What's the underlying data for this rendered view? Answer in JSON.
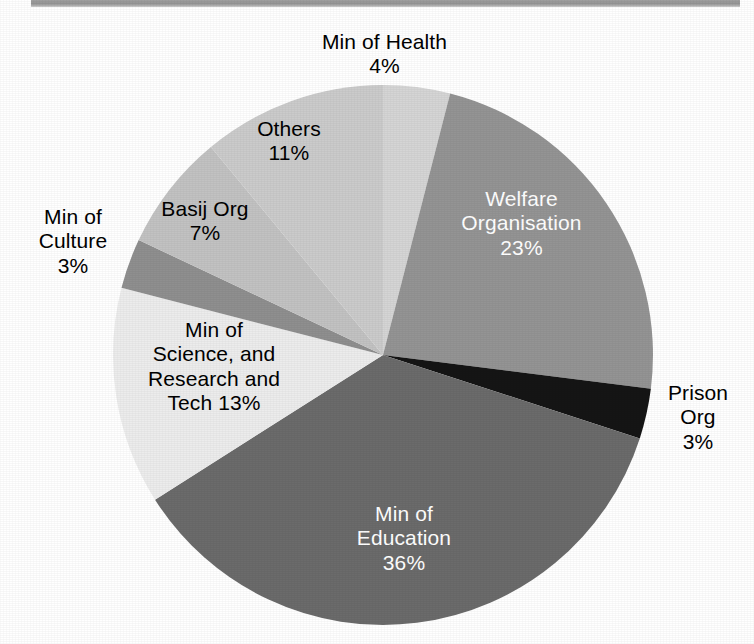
{
  "chart_data": {
    "type": "pie",
    "title": "",
    "subtitle": "",
    "xlabel": "",
    "ylabel": "",
    "legend_position": "none",
    "grid": false,
    "label_format": "name + percent",
    "categories": [
      "Min of Health",
      "Welfare Organisation",
      "Prison Org",
      "Min of Education",
      "Min of Science, and Research and Tech",
      "Min of Culture",
      "Basij Org",
      "Others"
    ],
    "values": [
      4,
      23,
      3,
      36,
      13,
      3,
      7,
      11
    ],
    "units": "percent",
    "slices": [
      {
        "name": "Min of Health",
        "label_line1": "Min of Health",
        "label_line2": "4%",
        "value": 4,
        "percent_text": "4%",
        "color": "#d5d5d5",
        "label_color": "#000000",
        "label_placement": "outside-top"
      },
      {
        "name": "Welfare Organisation",
        "label_line1": "Welfare",
        "label_line2": "Organisation",
        "label_line3": "23%",
        "value": 23,
        "percent_text": "23%",
        "color": "#949494",
        "label_color": "#ffffff",
        "label_placement": "inside"
      },
      {
        "name": "Prison Org",
        "label_line1": "Prison",
        "label_line2": "Org",
        "label_line3": "3%",
        "value": 3,
        "percent_text": "3%",
        "color": "#151515",
        "label_color": "#000000",
        "label_placement": "outside-right"
      },
      {
        "name": "Min of Education",
        "label_line1": "Min of",
        "label_line2": "Education",
        "label_line3": "36%",
        "value": 36,
        "percent_text": "36%",
        "color": "#6b6b6b",
        "label_color": "#ffffff",
        "label_placement": "inside"
      },
      {
        "name": "Min of Science, and Research and Tech",
        "label_line1": "Min of",
        "label_line2": "Science, and",
        "label_line3": "Research and",
        "label_line4": "Tech 13%",
        "value": 13,
        "percent_text": "13%",
        "color": "#ececec",
        "label_color": "#000000",
        "label_placement": "inside"
      },
      {
        "name": "Min of Culture",
        "label_line1": "Min of",
        "label_line2": "Culture",
        "label_line3": "3%",
        "value": 3,
        "percent_text": "3%",
        "color": "#8f8f8f",
        "label_color": "#000000",
        "label_placement": "outside-left"
      },
      {
        "name": "Basij Org",
        "label_line1": "Basij Org",
        "label_line2": "7%",
        "value": 7,
        "percent_text": "7%",
        "color": "#c2c2c2",
        "label_color": "#000000",
        "label_placement": "inside"
      },
      {
        "name": "Others",
        "label_line1": "Others",
        "label_line2": "11%",
        "value": 11,
        "percent_text": "11%",
        "color": "#cbcbcb",
        "label_color": "#000000",
        "label_placement": "inside"
      }
    ]
  },
  "labels": {
    "health": "Min of Health\n4%",
    "welfare": "Welfare\nOrganisation\n23%",
    "prison": "Prison\nOrg\n3%",
    "education": "Min of\nEducation\n36%",
    "science": "Min of\nScience, and\nResearch and\nTech 13%",
    "culture": "Min of\nCulture\n3%",
    "basij": "Basij Org\n7%",
    "others": "Others\n11%"
  }
}
